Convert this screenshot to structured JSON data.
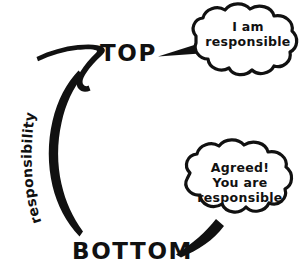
{
  "diagram": {
    "background_color": "#ffffff",
    "ink_color": "#111111",
    "nodes": {
      "top_label": "TOP",
      "bottom_label": "BOTTOM"
    },
    "arc": {
      "label": "responsibility",
      "direction": "bottom-to-top",
      "arrowhead": "up-right"
    },
    "bubbles": [
      {
        "id": "top-bubble",
        "speaker": "TOP",
        "shape": "cloud",
        "tail_direction": "left",
        "lines": [
          "I am",
          "responsible"
        ]
      },
      {
        "id": "bottom-bubble",
        "speaker": "BOTTOM",
        "shape": "cloud",
        "tail_direction": "down-left",
        "lines": [
          "Agreed!",
          "You are",
          "responsible"
        ]
      }
    ]
  }
}
